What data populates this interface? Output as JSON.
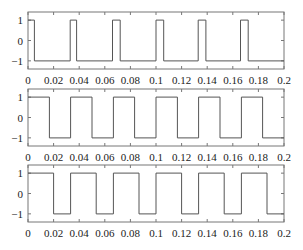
{
  "chart_data": [
    {
      "type": "line",
      "title": "",
      "xlabel": "",
      "ylabel": "",
      "xlim": [
        0,
        0.2
      ],
      "ylim": [
        -1.4,
        1.4
      ],
      "xticks": [
        "0",
        "0.02",
        "0.04",
        "0.06",
        "0.08",
        "0.1",
        "0.12",
        "0.14",
        "0.16",
        "0.18",
        "0.2"
      ],
      "yticks": [
        "1",
        "0",
        "-1"
      ],
      "grid": false,
      "waveform": "square",
      "period": 0.0333,
      "duty_cycle": 0.17,
      "series": [
        {
          "name": "square wave 1",
          "x": [
            0,
            0.005,
            0.005,
            0.033,
            0.033,
            0.038,
            0.038,
            0.066,
            0.066,
            0.072,
            0.072,
            0.1,
            0.1,
            0.106,
            0.106,
            0.133,
            0.133,
            0.139,
            0.139,
            0.166,
            0.166,
            0.172,
            0.172,
            0.2
          ],
          "y": [
            1,
            1,
            -1,
            -1,
            1,
            1,
            -1,
            -1,
            1,
            1,
            -1,
            -1,
            1,
            1,
            -1,
            -1,
            1,
            1,
            -1,
            -1,
            1,
            1,
            -1,
            -1
          ]
        }
      ]
    },
    {
      "type": "line",
      "title": "",
      "xlabel": "",
      "ylabel": "",
      "xlim": [
        0,
        0.2
      ],
      "ylim": [
        -1.4,
        1.4
      ],
      "xticks": [
        "0",
        "0.02",
        "0.04",
        "0.06",
        "0.08",
        "0.1",
        "0.12",
        "0.14",
        "0.16",
        "0.18",
        "0.2"
      ],
      "yticks": [
        "1",
        "0",
        "-1"
      ],
      "grid": false,
      "waveform": "square",
      "period": 0.0333,
      "duty_cycle": 0.5,
      "series": [
        {
          "name": "square wave 2",
          "x": [
            0,
            0.0167,
            0.0167,
            0.0333,
            0.0333,
            0.05,
            0.05,
            0.0667,
            0.0667,
            0.0833,
            0.0833,
            0.1,
            0.1,
            0.1167,
            0.1167,
            0.1333,
            0.1333,
            0.15,
            0.15,
            0.1667,
            0.1667,
            0.1833,
            0.1833,
            0.2
          ],
          "y": [
            1,
            1,
            -1,
            -1,
            1,
            1,
            -1,
            -1,
            1,
            1,
            -1,
            -1,
            1,
            1,
            -1,
            -1,
            1,
            1,
            -1,
            -1,
            1,
            1,
            -1,
            -1
          ]
        }
      ]
    },
    {
      "type": "line",
      "title": "",
      "xlabel": "",
      "ylabel": "",
      "xlim": [
        0,
        0.2
      ],
      "ylim": [
        -1.4,
        1.4
      ],
      "xticks": [
        "0",
        "0.02",
        "0.04",
        "0.06",
        "0.08",
        "0.1",
        "0.12",
        "0.14",
        "0.16",
        "0.18",
        "0.2"
      ],
      "yticks": [
        "1",
        "0",
        "-1"
      ],
      "grid": false,
      "waveform": "square",
      "period": 0.0333,
      "duty_cycle": 0.6,
      "series": [
        {
          "name": "square wave 3",
          "x": [
            0,
            0.02,
            0.02,
            0.0333,
            0.0333,
            0.0533,
            0.0533,
            0.0667,
            0.0667,
            0.0867,
            0.0867,
            0.1,
            0.1,
            0.12,
            0.12,
            0.1333,
            0.1333,
            0.1533,
            0.1533,
            0.1667,
            0.1667,
            0.1867,
            0.1867,
            0.2
          ],
          "y": [
            1,
            1,
            -1,
            -1,
            1,
            1,
            -1,
            -1,
            1,
            1,
            -1,
            -1,
            1,
            1,
            -1,
            -1,
            1,
            1,
            -1,
            -1,
            1,
            1,
            -1,
            -1
          ]
        }
      ]
    }
  ],
  "style": {
    "line_color": "#555555",
    "axis_color": "#777777",
    "text_color": "#222222"
  }
}
